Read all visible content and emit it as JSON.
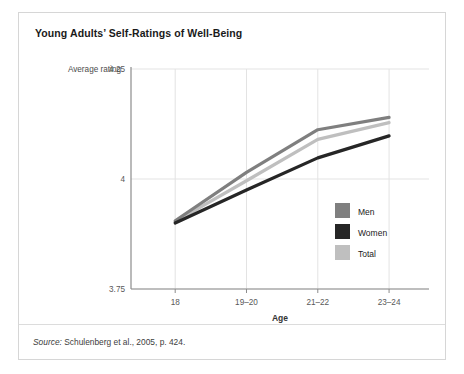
{
  "figure": {
    "title": "Young Adults’ Self-Ratings of Well-Being",
    "source_label": "Source:",
    "source_text": " Schulenberg et al., 2005, p. 424."
  },
  "chart_data": {
    "type": "line",
    "title": "Young Adults’ Self-Ratings of Well-Being",
    "xlabel": "Age",
    "ylabel": "Average rating",
    "categories": [
      "18",
      "19–20",
      "21–22",
      "23–24"
    ],
    "ylim": [
      3.75,
      4.25
    ],
    "yticks": [
      3.75,
      4.0,
      4.25
    ],
    "ytick_labels": [
      "3.75",
      "4",
      "4.25"
    ],
    "grid": true,
    "legend_position": "inside-right",
    "series": [
      {
        "name": "Men",
        "color": "#7f7f7f",
        "values": [
          3.905,
          4.015,
          4.112,
          4.14
        ]
      },
      {
        "name": "Women",
        "color": "#262626",
        "values": [
          3.9,
          3.975,
          4.048,
          4.098
        ]
      },
      {
        "name": "Total",
        "color": "#bfbfbf",
        "values": [
          3.903,
          3.996,
          4.09,
          4.128
        ]
      }
    ]
  },
  "legend": {
    "items": [
      {
        "label": "Men",
        "color": "#7f7f7f"
      },
      {
        "label": "Women",
        "color": "#262626"
      },
      {
        "label": "Total",
        "color": "#bfbfbf"
      }
    ]
  },
  "colors": {
    "card_border": "#d6d6d6",
    "grid": "#e3e3e3",
    "axis": "#8c8c8c"
  }
}
